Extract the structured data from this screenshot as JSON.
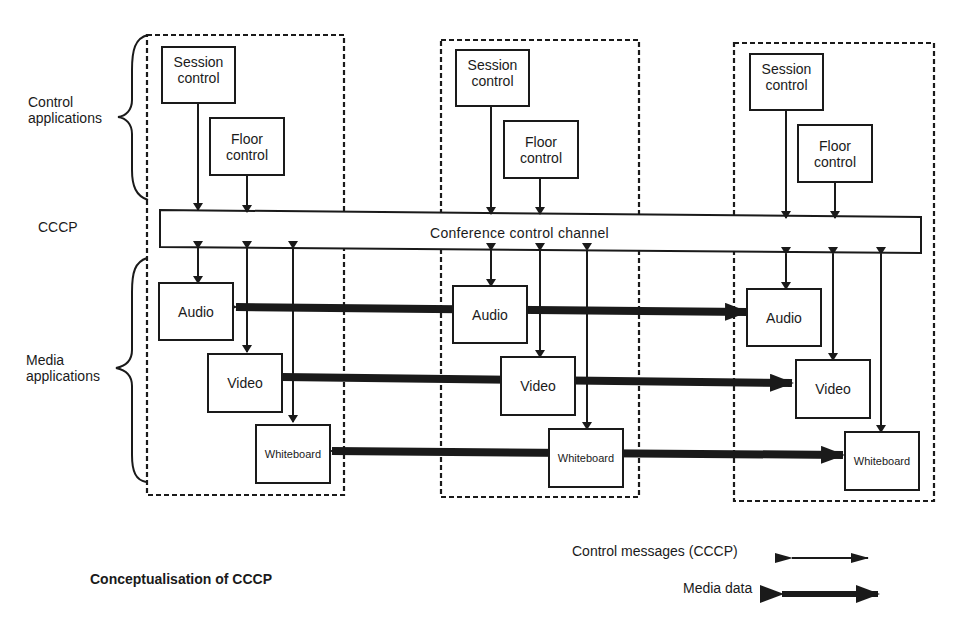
{
  "left_labels": {
    "control_applications": "Control\napplications",
    "cccp": "CCCP",
    "media_applications": "Media\napplications"
  },
  "channel": {
    "label": "Conference control channel"
  },
  "sites": [
    {
      "session_control": "Session\ncontrol",
      "floor_control": "Floor\ncontrol",
      "audio": "Audio",
      "video": "Video",
      "whiteboard": "Whiteboard"
    },
    {
      "session_control": "Session\ncontrol",
      "floor_control": "Floor\ncontrol",
      "audio": "Audio",
      "video": "Video",
      "whiteboard": "Whiteboard"
    },
    {
      "session_control": "Session\ncontrol",
      "floor_control": "Floor\ncontrol",
      "audio": "Audio",
      "video": "Video",
      "whiteboard": "Whiteboard"
    }
  ],
  "caption": "Conceptualisation of CCCP",
  "legend": {
    "control_messages": "Control messages (CCCP)",
    "media_data": "Media data"
  },
  "colors": {
    "ink": "#1a1a1a",
    "background": "#ffffff"
  }
}
